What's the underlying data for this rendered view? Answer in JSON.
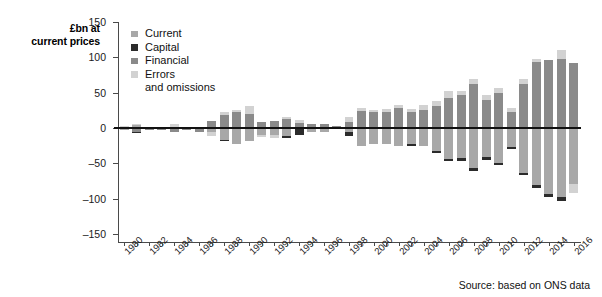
{
  "chart_data": {
    "type": "bar",
    "stacked": true,
    "title": "",
    "ylabel": "£bn at current prices",
    "xlabel": "",
    "ylim": [
      -150,
      150
    ],
    "yticks": [
      150,
      100,
      50,
      0,
      -50,
      -100,
      -150
    ],
    "grid": false,
    "legend_position": "top-left",
    "source": "Source: based on ONS data",
    "x": [
      1980,
      1981,
      1982,
      1983,
      1984,
      1985,
      1986,
      1987,
      1988,
      1989,
      1990,
      1991,
      1992,
      1993,
      1994,
      1995,
      1996,
      1997,
      1998,
      1999,
      2000,
      2001,
      2002,
      2003,
      2004,
      2005,
      2006,
      2007,
      2008,
      2009,
      2010,
      2011,
      2012,
      2013,
      2014,
      2015,
      2016
    ],
    "xtick_labels": [
      "1980",
      "1982",
      "1984",
      "1986",
      "1988",
      "1990",
      "1992",
      "1994",
      "1996",
      "1998",
      "2000",
      "2002",
      "2004",
      "2006",
      "2008",
      "2010",
      "2012",
      "2014",
      "2016"
    ],
    "series": [
      {
        "name": "Current",
        "color": "#a8a8a8",
        "values": [
          3,
          6,
          4,
          3,
          1,
          2,
          -1,
          -5,
          -17,
          -22,
          -19,
          -10,
          -10,
          -10,
          -1,
          -5,
          -6,
          -1,
          -5,
          -24,
          -22,
          -22,
          -24,
          -21,
          -25,
          -32,
          -43,
          -42,
          -55,
          -40,
          -48,
          -26,
          -62,
          -80,
          -93,
          -97,
          -97
        ]
      },
      {
        "name": "Capital",
        "color": "#2b2b2b",
        "values": [
          0,
          0,
          0,
          0,
          0,
          0,
          0,
          0,
          0,
          0,
          0,
          0,
          0,
          0,
          0,
          0,
          0,
          1,
          1,
          1,
          1,
          1,
          1,
          1,
          2,
          2,
          2,
          2,
          3,
          3,
          4,
          4,
          4,
          4,
          2,
          2,
          2
        ]
      },
      {
        "name": "Financial",
        "color": "#8a8a8a",
        "values": [
          -4,
          -6,
          -5,
          -3,
          -2,
          -3,
          1,
          5,
          15,
          22,
          18,
          8,
          9,
          11,
          2,
          5,
          7,
          2,
          7,
          22,
          20,
          20,
          26,
          20,
          24,
          30,
          41,
          45,
          52,
          34,
          45,
          21,
          60,
          77,
          92,
          95,
          90
        ]
      },
      {
        "name": "Errors and omissions",
        "color": "#d2d2d2",
        "values": [
          1,
          1,
          1,
          1,
          1,
          1,
          1,
          2,
          4,
          6,
          5,
          3,
          3,
          3,
          2,
          2,
          2,
          2,
          4,
          7,
          6,
          6,
          8,
          5,
          6,
          7,
          8,
          10,
          14,
          9,
          10,
          7,
          9,
          8,
          7,
          6,
          14
        ]
      }
    ],
    "bars": [
      {
        "year": 1980,
        "pos": [
          {
            "s": "Financial",
            "v": 0
          },
          {
            "s": "Errors",
            "v": 3
          }
        ],
        "neg": [
          {
            "s": "Current",
            "v": -3
          }
        ]
      },
      {
        "year": 1981,
        "pos": [
          {
            "s": "Current",
            "v": 4
          },
          {
            "s": "Errors",
            "v": 2
          }
        ],
        "neg": [
          {
            "s": "Financial",
            "v": -6
          },
          {
            "s": "Capital",
            "v": -1
          }
        ]
      },
      {
        "year": 1982,
        "pos": [
          {
            "s": "Current",
            "v": 2
          }
        ],
        "neg": [
          {
            "s": "Financial",
            "v": -3
          }
        ]
      },
      {
        "year": 1983,
        "pos": [
          {
            "s": "Current",
            "v": 2
          }
        ],
        "neg": [
          {
            "s": "Financial",
            "v": -3
          }
        ]
      },
      {
        "year": 1984,
        "pos": [
          {
            "s": "Current",
            "v": 2
          },
          {
            "s": "Errors",
            "v": 3
          }
        ],
        "neg": [
          {
            "s": "Financial",
            "v": -6
          }
        ]
      },
      {
        "year": 1985,
        "pos": [
          {
            "s": "Current",
            "v": 2
          }
        ],
        "neg": [
          {
            "s": "Financial",
            "v": -3
          }
        ]
      },
      {
        "year": 1986,
        "pos": [
          {
            "s": "Errors",
            "v": 2
          }
        ],
        "neg": [
          {
            "s": "Current",
            "v": -2
          },
          {
            "s": "Financial",
            "v": -3
          }
        ]
      },
      {
        "year": 1987,
        "pos": [
          {
            "s": "Financial",
            "v": 10
          }
        ],
        "neg": [
          {
            "s": "Current",
            "v": -6
          },
          {
            "s": "Errors",
            "v": -5
          }
        ]
      },
      {
        "year": 1988,
        "pos": [
          {
            "s": "Financial",
            "v": 19
          },
          {
            "s": "Errors",
            "v": 3
          }
        ],
        "neg": [
          {
            "s": "Current",
            "v": -17
          },
          {
            "s": "Capital",
            "v": -2
          }
        ]
      },
      {
        "year": 1989,
        "pos": [
          {
            "s": "Financial",
            "v": 23
          },
          {
            "s": "Errors",
            "v": 3
          }
        ],
        "neg": [
          {
            "s": "Current",
            "v": -23
          }
        ]
      },
      {
        "year": 1990,
        "pos": [
          {
            "s": "Financial",
            "v": 20
          },
          {
            "s": "Errors",
            "v": 11
          }
        ],
        "neg": [
          {
            "s": "Current",
            "v": -19
          }
        ]
      },
      {
        "year": 1991,
        "pos": [
          {
            "s": "Financial",
            "v": 9
          }
        ],
        "neg": [
          {
            "s": "Current",
            "v": -10
          },
          {
            "s": "Errors",
            "v": -3
          }
        ]
      },
      {
        "year": 1992,
        "pos": [
          {
            "s": "Financial",
            "v": 10
          }
        ],
        "neg": [
          {
            "s": "Current",
            "v": -10
          },
          {
            "s": "Errors",
            "v": -4
          }
        ]
      },
      {
        "year": 1993,
        "pos": [
          {
            "s": "Financial",
            "v": 13
          },
          {
            "s": "Errors",
            "v": 3
          }
        ],
        "neg": [
          {
            "s": "Current",
            "v": -11
          },
          {
            "s": "Capital",
            "v": -3
          }
        ]
      },
      {
        "year": 1994,
        "pos": [
          {
            "s": "Financial",
            "v": 7
          },
          {
            "s": "Errors",
            "v": 5
          }
        ],
        "neg": [
          {
            "s": "Current",
            "v": -2
          },
          {
            "s": "Capital",
            "v": -8
          }
        ]
      },
      {
        "year": 1995,
        "pos": [
          {
            "s": "Financial",
            "v": 6
          }
        ],
        "neg": [
          {
            "s": "Current",
            "v": -6
          }
        ]
      },
      {
        "year": 1996,
        "pos": [
          {
            "s": "Financial",
            "v": 5
          }
        ],
        "neg": [
          {
            "s": "Current",
            "v": -5
          }
        ]
      },
      {
        "year": 1997,
        "pos": [
          {
            "s": "Financial",
            "v": 3
          }
        ],
        "neg": [
          {
            "s": "Current",
            "v": -2
          }
        ]
      },
      {
        "year": 1998,
        "pos": [
          {
            "s": "Financial",
            "v": 9
          },
          {
            "s": "Errors",
            "v": 6
          }
        ],
        "neg": [
          {
            "s": "Current",
            "v": -6
          },
          {
            "s": "Capital",
            "v": -6
          }
        ]
      },
      {
        "year": 1999,
        "pos": [
          {
            "s": "Financial",
            "v": 24
          },
          {
            "s": "Errors",
            "v": 4
          }
        ],
        "neg": [
          {
            "s": "Current",
            "v": -25
          }
        ]
      },
      {
        "year": 2000,
        "pos": [
          {
            "s": "Financial",
            "v": 22
          },
          {
            "s": "Errors",
            "v": 4
          }
        ],
        "neg": [
          {
            "s": "Current",
            "v": -23
          }
        ]
      },
      {
        "year": 2001,
        "pos": [
          {
            "s": "Financial",
            "v": 22
          },
          {
            "s": "Errors",
            "v": 5
          }
        ],
        "neg": [
          {
            "s": "Current",
            "v": -23
          }
        ]
      },
      {
        "year": 2002,
        "pos": [
          {
            "s": "Financial",
            "v": 28
          },
          {
            "s": "Errors",
            "v": 4
          }
        ],
        "neg": [
          {
            "s": "Current",
            "v": -25
          }
        ]
      },
      {
        "year": 2003,
        "pos": [
          {
            "s": "Financial",
            "v": 22
          },
          {
            "s": "Errors",
            "v": 5
          }
        ],
        "neg": [
          {
            "s": "Current",
            "v": -22
          },
          {
            "s": "Capital",
            "v": -3
          }
        ]
      },
      {
        "year": 2004,
        "pos": [
          {
            "s": "Financial",
            "v": 26
          },
          {
            "s": "Errors",
            "v": 6
          }
        ],
        "neg": [
          {
            "s": "Current",
            "v": -26
          }
        ]
      },
      {
        "year": 2005,
        "pos": [
          {
            "s": "Financial",
            "v": 31
          },
          {
            "s": "Errors",
            "v": 7
          }
        ],
        "neg": [
          {
            "s": "Current",
            "v": -33
          },
          {
            "s": "Capital",
            "v": -2
          }
        ]
      },
      {
        "year": 2006,
        "pos": [
          {
            "s": "Financial",
            "v": 43
          },
          {
            "s": "Errors",
            "v": 9
          }
        ],
        "neg": [
          {
            "s": "Current",
            "v": -44
          },
          {
            "s": "Capital",
            "v": -3
          }
        ]
      },
      {
        "year": 2007,
        "pos": [
          {
            "s": "Financial",
            "v": 47
          },
          {
            "s": "Errors",
            "v": 5
          }
        ],
        "neg": [
          {
            "s": "Current",
            "v": -43
          },
          {
            "s": "Capital",
            "v": -4
          }
        ]
      },
      {
        "year": 2008,
        "pos": [
          {
            "s": "Financial",
            "v": 62
          },
          {
            "s": "Errors",
            "v": 8
          }
        ],
        "neg": [
          {
            "s": "Current",
            "v": -56
          },
          {
            "s": "Capital",
            "v": -5
          }
        ]
      },
      {
        "year": 2009,
        "pos": [
          {
            "s": "Financial",
            "v": 40
          },
          {
            "s": "Errors",
            "v": 6
          }
        ],
        "neg": [
          {
            "s": "Current",
            "v": -41
          },
          {
            "s": "Capital",
            "v": -4
          }
        ]
      },
      {
        "year": 2010,
        "pos": [
          {
            "s": "Financial",
            "v": 50
          },
          {
            "s": "Errors",
            "v": 6
          }
        ],
        "neg": [
          {
            "s": "Current",
            "v": -49
          },
          {
            "s": "Capital",
            "v": -4
          }
        ]
      },
      {
        "year": 2011,
        "pos": [
          {
            "s": "Financial",
            "v": 23
          },
          {
            "s": "Errors",
            "v": 5
          }
        ],
        "neg": [
          {
            "s": "Current",
            "v": -27
          },
          {
            "s": "Capital",
            "v": -3
          }
        ]
      },
      {
        "year": 2012,
        "pos": [
          {
            "s": "Financial",
            "v": 62
          },
          {
            "s": "Errors",
            "v": 7
          }
        ],
        "neg": [
          {
            "s": "Current",
            "v": -63
          },
          {
            "s": "Capital",
            "v": -3
          }
        ]
      },
      {
        "year": 2013,
        "pos": [
          {
            "s": "Financial",
            "v": 93
          },
          {
            "s": "Errors",
            "v": 5
          }
        ],
        "neg": [
          {
            "s": "Current",
            "v": -81
          },
          {
            "s": "Capital",
            "v": -4
          }
        ]
      },
      {
        "year": 2014,
        "pos": [
          {
            "s": "Financial",
            "v": 96
          }
        ],
        "neg": [
          {
            "s": "Current",
            "v": -94
          },
          {
            "s": "Capital",
            "v": -4
          }
        ]
      },
      {
        "year": 2015,
        "pos": [
          {
            "s": "Financial",
            "v": 98
          },
          {
            "s": "Errors",
            "v": 13
          }
        ],
        "neg": [
          {
            "s": "Current",
            "v": -98
          },
          {
            "s": "Capital",
            "v": -5
          }
        ]
      },
      {
        "year": 2016,
        "pos": [
          {
            "s": "Financial",
            "v": 92
          }
        ],
        "neg": [
          {
            "s": "Current",
            "v": -79
          },
          {
            "s": "Errors",
            "v": -13
          }
        ]
      }
    ]
  },
  "legend": {
    "items": [
      {
        "label": "Current",
        "color": "#a8a8a8"
      },
      {
        "label": "Capital",
        "color": "#2b2b2b"
      },
      {
        "label": "Financial",
        "color": "#8a8a8a"
      },
      {
        "label": "Errors",
        "label2": "and omissions",
        "color": "#d2d2d2"
      }
    ]
  },
  "axis": {
    "y_title_line1": "£bn at",
    "y_title_line2": "current prices"
  },
  "footer": {
    "source": "Source: based on ONS data"
  }
}
